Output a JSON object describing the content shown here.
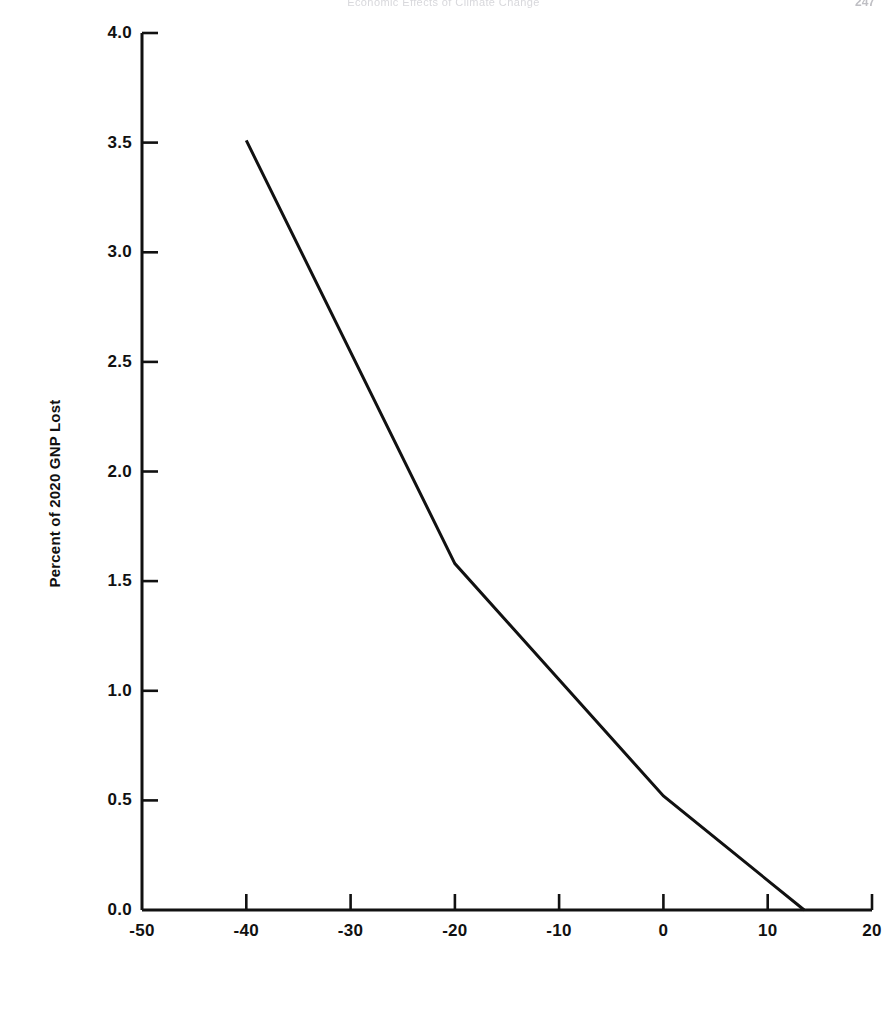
{
  "page": {
    "header_text": "Economic Effects of Climate Change",
    "page_number": "247"
  },
  "figure": {
    "ylabel": "Percent of 2020 GNP Lost"
  },
  "chart_data": {
    "type": "line",
    "title": "",
    "subtitle": "",
    "xlabel": "",
    "ylabel": "Percent of 2020 GNP Lost",
    "xlim": [
      -50,
      20
    ],
    "ylim": [
      0.0,
      4.0
    ],
    "xticks": [
      -50,
      -40,
      -30,
      -20,
      -10,
      0,
      10,
      20
    ],
    "xtick_labels": [
      "-50",
      "-40",
      "-30",
      "-20",
      "-10",
      "0",
      "10",
      "20"
    ],
    "yticks": [
      0.0,
      0.5,
      1.0,
      1.5,
      2.0,
      2.5,
      3.0,
      3.5,
      4.0
    ],
    "ytick_labels": [
      "0.0",
      "0.5",
      "1.0",
      "1.5",
      "2.0",
      "2.5",
      "3.0",
      "3.5",
      "4.0"
    ],
    "grid": false,
    "legend": null,
    "tick_direction": "in",
    "series": [
      {
        "name": "GNP loss",
        "x": [
          -40,
          -20,
          0,
          13.5
        ],
        "values": [
          3.51,
          1.58,
          0.52,
          0.0
        ],
        "color": "#111111",
        "linewidth": 1.6
      }
    ],
    "annotations": []
  }
}
